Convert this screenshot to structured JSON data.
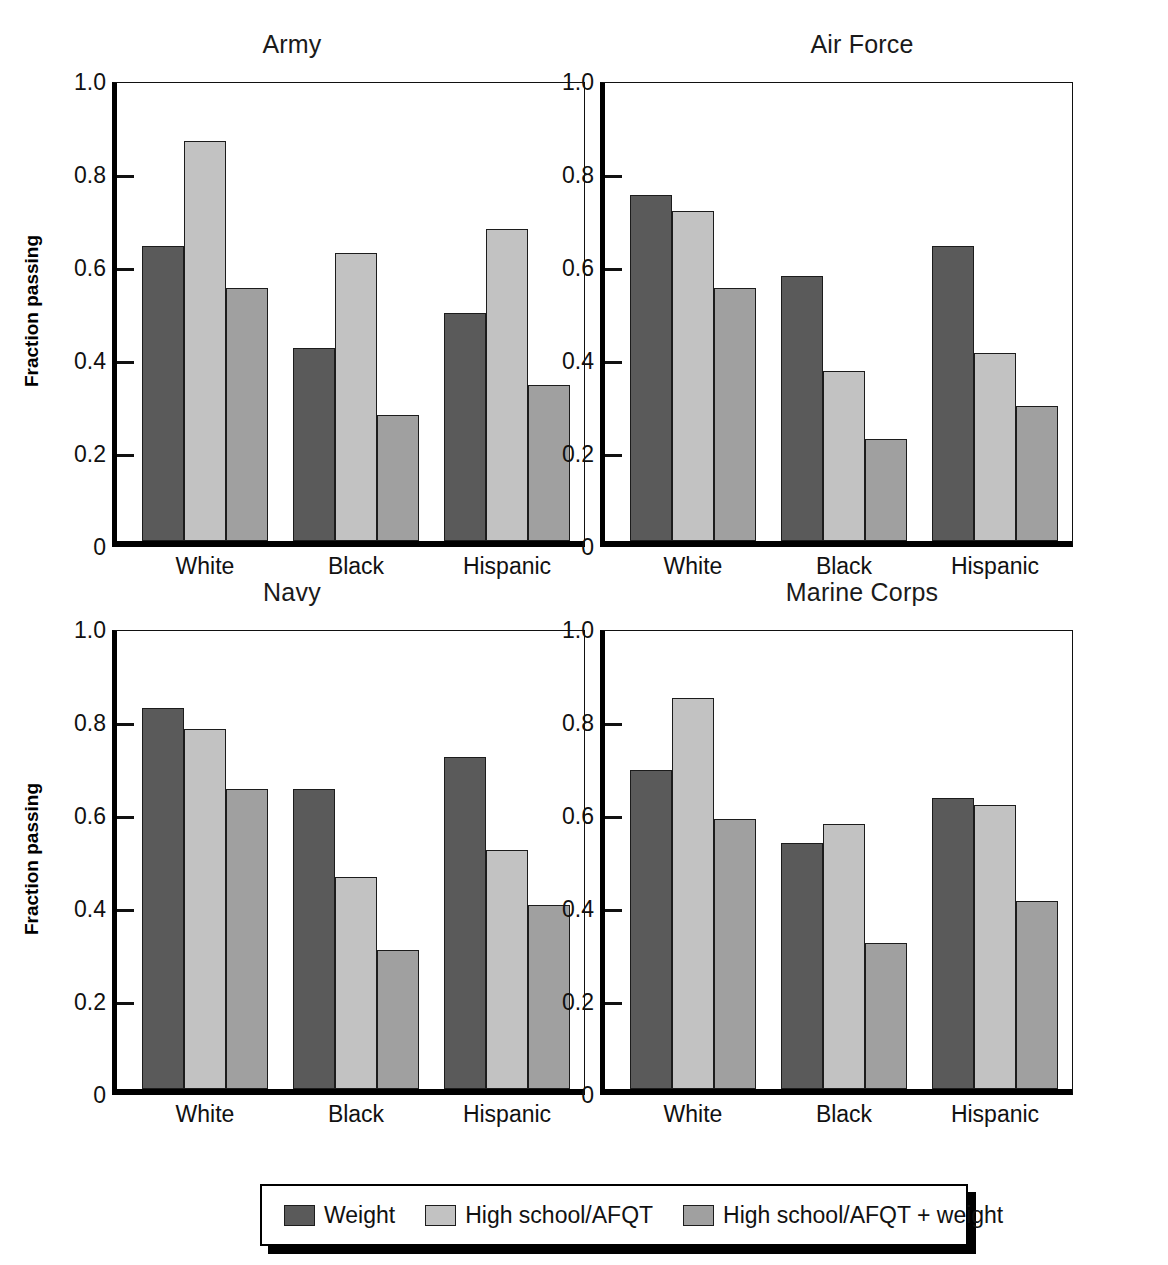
{
  "chart_data": {
    "type": "bar",
    "title": "",
    "xlabel": "",
    "ylabel": "Fraction passing",
    "ylim": [
      0,
      1.0
    ],
    "yticks": [
      0,
      0.2,
      0.4,
      0.6,
      0.8,
      1.0
    ],
    "ytick_labels": [
      "0",
      "0.2",
      "0.4",
      "0.6",
      "0.8",
      "1.0"
    ],
    "categories": [
      "White",
      "Black",
      "Hispanic"
    ],
    "grid": false,
    "legend_position": "bottom",
    "series_names": [
      "Weight",
      "High school/AFQT",
      "High school/AFQT + weight"
    ],
    "series_colors": [
      "#5a5a5a",
      "#c2c2c2",
      "#a0a0a0"
    ],
    "panels": [
      {
        "title": "Army",
        "ylabel": "Fraction passing",
        "series": [
          {
            "name": "Weight",
            "color": "#5a5a5a",
            "values": [
              0.635,
              0.415,
              0.49
            ]
          },
          {
            "name": "High school/AFQT",
            "color": "#c2c2c2",
            "values": [
              0.86,
              0.62,
              0.67
            ]
          },
          {
            "name": "High school/AFQT + weight",
            "color": "#a0a0a0",
            "values": [
              0.545,
              0.27,
              0.335
            ]
          }
        ]
      },
      {
        "title": "Air Force",
        "ylabel": "",
        "series": [
          {
            "name": "Weight",
            "color": "#5a5a5a",
            "values": [
              0.745,
              0.57,
              0.635
            ]
          },
          {
            "name": "High school/AFQT",
            "color": "#c2c2c2",
            "values": [
              0.71,
              0.365,
              0.405
            ]
          },
          {
            "name": "High school/AFQT + weight",
            "color": "#a0a0a0",
            "values": [
              0.545,
              0.22,
              0.29
            ]
          }
        ]
      },
      {
        "title": "Navy",
        "ylabel": "Fraction passing",
        "series": [
          {
            "name": "Weight",
            "color": "#5a5a5a",
            "values": [
              0.82,
              0.645,
              0.715
            ]
          },
          {
            "name": "High school/AFQT",
            "color": "#c2c2c2",
            "values": [
              0.775,
              0.455,
              0.515
            ]
          },
          {
            "name": "High school/AFQT + weight",
            "color": "#a0a0a0",
            "values": [
              0.645,
              0.3,
              0.395
            ]
          }
        ]
      },
      {
        "title": "Marine Corps",
        "ylabel": "",
        "series": [
          {
            "name": "Weight",
            "color": "#5a5a5a",
            "values": [
              0.685,
              0.53,
              0.625
            ]
          },
          {
            "name": "High school/AFQT",
            "color": "#c2c2c2",
            "values": [
              0.84,
              0.57,
              0.61
            ]
          },
          {
            "name": "High school/AFQT + weight",
            "color": "#a0a0a0",
            "values": [
              0.58,
              0.315,
              0.405
            ]
          }
        ]
      }
    ]
  },
  "legend": {
    "items": [
      {
        "label": "Weight",
        "color": "#5a5a5a"
      },
      {
        "label": "High school/AFQT",
        "color": "#c2c2c2"
      },
      {
        "label": "High school/AFQT + weight",
        "color": "#a0a0a0"
      }
    ]
  }
}
